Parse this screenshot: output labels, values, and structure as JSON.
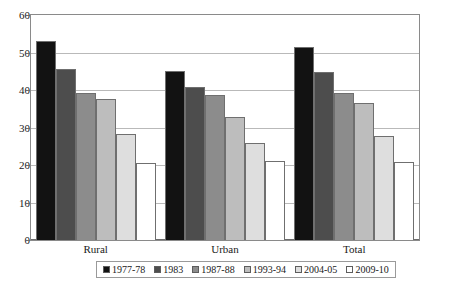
{
  "chart_data": {
    "type": "bar",
    "title": "",
    "subtitle": "",
    "xlabel": "",
    "ylabel": "",
    "categories": [
      "Rural",
      "Urban",
      "Total"
    ],
    "series": [
      {
        "name": "1977-78",
        "color": "#121212",
        "values": [
          53.0,
          45.2,
          51.5
        ]
      },
      {
        "name": "1983",
        "color": "#4d4d4d",
        "values": [
          45.7,
          40.7,
          44.9
        ]
      },
      {
        "name": "1987-88",
        "color": "#8c8c8c",
        "values": [
          39.1,
          38.8,
          39.1
        ]
      },
      {
        "name": "1993-94",
        "color": "#bdbdbd",
        "values": [
          37.7,
          32.8,
          36.6
        ]
      },
      {
        "name": "2004-05",
        "color": "#dedede",
        "values": [
          28.3,
          26.0,
          27.8
        ]
      },
      {
        "name": "2009-10",
        "color": "#ffffff",
        "values": [
          20.5,
          21.0,
          20.8
        ]
      }
    ],
    "ylim": [
      0,
      60
    ],
    "yticks": [
      0,
      10,
      20,
      30,
      40,
      50,
      60
    ],
    "ytick_labels": [
      "0",
      "10",
      "20",
      "30",
      "40",
      "50",
      "60"
    ],
    "grid": true,
    "legend_position": "bottom"
  }
}
